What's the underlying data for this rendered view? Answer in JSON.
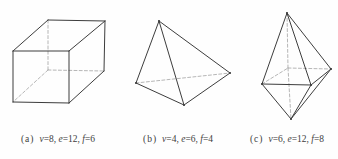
{
  "diagram": {
    "background": "#fefefe",
    "solid_color": "#3d3d3d",
    "hidden_color": "#a3a3a3",
    "caption_color": "#3c3c3c",
    "figures": [
      {
        "name": "cube",
        "caption": {
          "label": "(a)",
          "terms": [
            {
              "sym": "v",
              "val": "8"
            },
            {
              "sym": "e",
              "val": "12"
            },
            {
              "sym": "f",
              "val": "6"
            }
          ]
        },
        "vertices": {
          "ftl": [
            13,
            51
          ],
          "ftr": [
            69,
            51
          ],
          "fbl": [
            13,
            102
          ],
          "fbr": [
            69,
            103
          ],
          "btl": [
            48,
            20
          ],
          "btr": [
            105,
            21
          ],
          "bbl": [
            48,
            70
          ],
          "bbr": [
            104,
            71
          ]
        },
        "solid_edges": [
          [
            "ftl",
            "ftr"
          ],
          [
            "ftr",
            "fbr"
          ],
          [
            "fbr",
            "fbl"
          ],
          [
            "fbl",
            "ftl"
          ],
          [
            "ftl",
            "btl"
          ],
          [
            "btl",
            "btr"
          ],
          [
            "btr",
            "ftr"
          ],
          [
            "btr",
            "bbr"
          ],
          [
            "bbr",
            "fbr"
          ]
        ],
        "hidden_edges": [
          [
            "btl",
            "bbl"
          ],
          [
            "bbl",
            "bbr"
          ],
          [
            "bbl",
            "fbl"
          ]
        ],
        "dots": []
      },
      {
        "name": "tetrahedron",
        "caption": {
          "label": "(b)",
          "terms": [
            {
              "sym": "v",
              "val": "4"
            },
            {
              "sym": "e",
              "val": "6"
            },
            {
              "sym": "f",
              "val": "4"
            }
          ]
        },
        "vertices": {
          "apex": [
            159,
            21
          ],
          "left": [
            136,
            83
          ],
          "right": [
            230,
            73
          ],
          "front": [
            184,
            105
          ]
        },
        "solid_edges": [
          [
            "apex",
            "left"
          ],
          [
            "apex",
            "front"
          ],
          [
            "apex",
            "right"
          ],
          [
            "left",
            "front"
          ],
          [
            "front",
            "right"
          ]
        ],
        "hidden_edges": [
          [
            "left",
            "right"
          ]
        ],
        "dots": [
          "apex",
          "left",
          "right",
          "front"
        ]
      },
      {
        "name": "octahedron",
        "caption": {
          "label": "(c)",
          "terms": [
            {
              "sym": "v",
              "val": "6"
            },
            {
              "sym": "e",
              "val": "12"
            },
            {
              "sym": "f",
              "val": "8"
            }
          ]
        },
        "vertices": {
          "top": [
            287,
            13
          ],
          "bottom": [
            291,
            119
          ],
          "left": [
            262,
            84
          ],
          "right": [
            331,
            69
          ],
          "front": [
            311,
            85
          ],
          "back": [
            288,
            68
          ]
        },
        "solid_edges": [
          [
            "top",
            "left"
          ],
          [
            "top",
            "front"
          ],
          [
            "top",
            "right"
          ],
          [
            "bottom",
            "left"
          ],
          [
            "bottom",
            "front"
          ],
          [
            "bottom",
            "right"
          ],
          [
            "left",
            "front"
          ],
          [
            "front",
            "right"
          ]
        ],
        "hidden_edges": [
          [
            "top",
            "back"
          ],
          [
            "back",
            "bottom"
          ],
          [
            "left",
            "back"
          ],
          [
            "back",
            "right"
          ]
        ],
        "dots": [
          "top",
          "bottom",
          "left",
          "right",
          "front"
        ]
      }
    ]
  }
}
